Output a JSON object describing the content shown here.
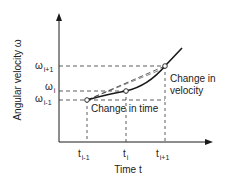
{
  "diagram": {
    "y_axis_label": "Angular velocity ω",
    "x_axis_label": "Time t",
    "y_ticks": [
      {
        "base": "ω",
        "sub": "i+1"
      },
      {
        "base": "ω",
        "sub": "i"
      },
      {
        "base": "ω",
        "sub": "i-1"
      }
    ],
    "x_ticks": [
      {
        "base": "t",
        "sub": "i-1"
      },
      {
        "base": "t",
        "sub": "i"
      },
      {
        "base": "t",
        "sub": "i+1"
      }
    ],
    "annotations": {
      "change_in_time": "Change in time",
      "change_in_velocity_line1": "Change in",
      "change_in_velocity_line2": "velocity"
    },
    "colors": {
      "line": "#1a1a1a",
      "dashed": "#333333",
      "background": "#ffffff"
    }
  }
}
